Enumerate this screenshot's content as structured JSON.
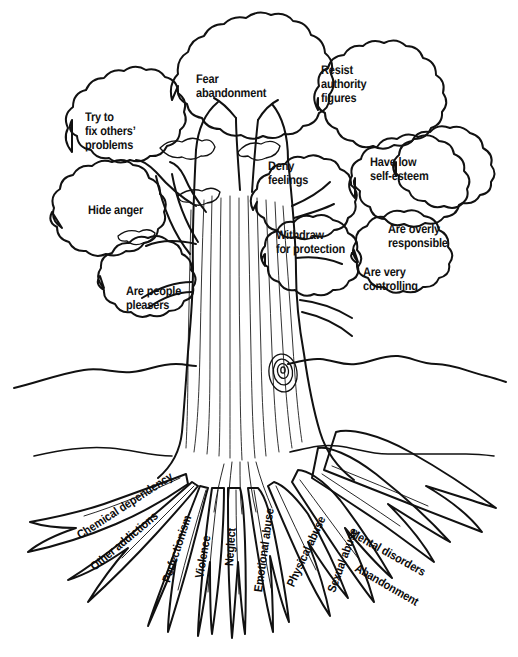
{
  "diagram": {
    "subtitle": "Behaviors in the branches, root causes in the roots",
    "ink_color": "#111111",
    "background_color": "#ffffff"
  },
  "canopy": {
    "section_name": "branches-and-leaves",
    "labels": [
      {
        "id": "fear-abandonment",
        "text": "Fear\nabandonment",
        "x": 196,
        "y": 72,
        "align": "left"
      },
      {
        "id": "try-to-fix-others",
        "text": "Try to\nfix others’\nproblems",
        "x": 85,
        "y": 110,
        "align": "left"
      },
      {
        "id": "resist-authority",
        "text": "Resist\nauthority\nfigures",
        "x": 321,
        "y": 63,
        "align": "left"
      },
      {
        "id": "deny-feelings",
        "text": "Deny\nfeelings",
        "x": 268,
        "y": 159,
        "align": "left"
      },
      {
        "id": "have-low-self-esteem",
        "text": "Have low\nself-esteem",
        "x": 370,
        "y": 155,
        "align": "left"
      },
      {
        "id": "hide-anger",
        "text": "Hide anger",
        "x": 88,
        "y": 203,
        "align": "left"
      },
      {
        "id": "withdraw-for-protection",
        "text": "Withdraw\nfor protection",
        "x": 276,
        "y": 228,
        "align": "left"
      },
      {
        "id": "are-overly-responsible",
        "text": "Are overly\nresponsible",
        "x": 388,
        "y": 222,
        "align": "left"
      },
      {
        "id": "are-people-pleasers",
        "text": "Are people\npleasers",
        "x": 126,
        "y": 284,
        "align": "left"
      },
      {
        "id": "are-very-controlling",
        "text": "Are very\ncontrolling",
        "x": 363,
        "y": 265,
        "align": "left"
      }
    ]
  },
  "roots": {
    "section_name": "root-system",
    "labels": [
      {
        "id": "chemical-dependency",
        "text": "Chemical dependency",
        "x": 78,
        "y": 530,
        "rotate": -33
      },
      {
        "id": "other-addictions",
        "text": "Other addictions",
        "x": 92,
        "y": 562,
        "rotate": -40
      },
      {
        "id": "perfectionism",
        "text": "Perfectionism",
        "x": 166,
        "y": 576,
        "rotate": -72
      },
      {
        "id": "violence",
        "text": "Violence",
        "x": 199,
        "y": 572,
        "rotate": -80
      },
      {
        "id": "neglect",
        "text": "Neglect",
        "x": 229,
        "y": 560,
        "rotate": -86
      },
      {
        "id": "emotional-abuse",
        "text": "Emotional abuse",
        "x": 258,
        "y": 586,
        "rotate": -82
      },
      {
        "id": "physical-abuse",
        "text": "Physical abuse",
        "x": 290,
        "y": 580,
        "rotate": -65
      },
      {
        "id": "sexual-abuse",
        "text": "Sexual abuse",
        "x": 331,
        "y": 586,
        "rotate": -70
      },
      {
        "id": "mental-disorders",
        "text": "Mental disorders",
        "x": 351,
        "y": 526,
        "rotate": 29
      },
      {
        "id": "abandonment",
        "text": "Abandonment",
        "x": 356,
        "y": 561,
        "rotate": 30
      }
    ]
  },
  "watermark": {
    "top_text": "",
    "bottom_text": ""
  }
}
